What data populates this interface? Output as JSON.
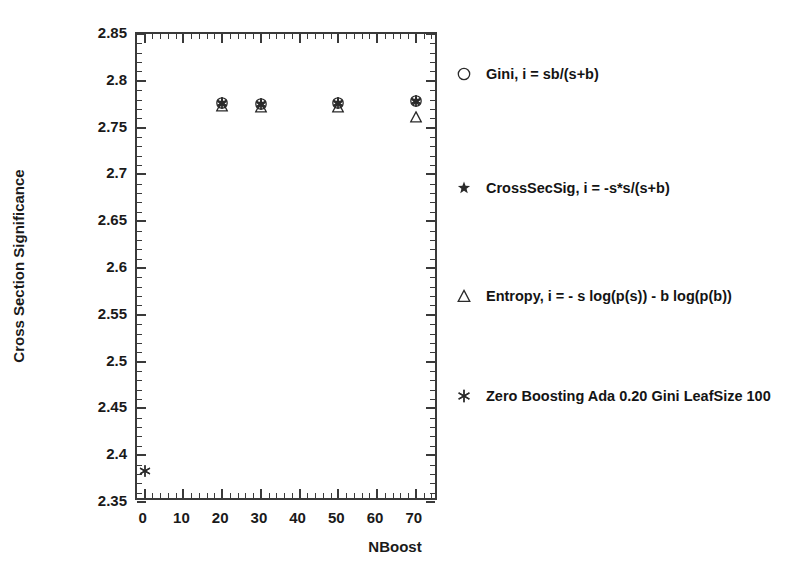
{
  "chart_data": {
    "type": "scatter",
    "title": "",
    "xlabel": "NBoost",
    "ylabel": "Cross Section Significance",
    "xlim": [
      -2,
      76
    ],
    "ylim": [
      2.35,
      2.85
    ],
    "xticks": [
      0,
      10,
      20,
      30,
      40,
      50,
      60,
      70
    ],
    "yticks": [
      2.35,
      2.4,
      2.45,
      2.5,
      2.55,
      2.6,
      2.65,
      2.7,
      2.75,
      2.8,
      2.85
    ],
    "ytick_step": 0.05,
    "yminor_per_major": 5,
    "xminor_per_major": 5,
    "grid": false,
    "legend_position": "right",
    "series": [
      {
        "name": "Gini, i = sb/(s+b)",
        "marker": "circle",
        "x": [
          20,
          30,
          50,
          70
        ],
        "y": [
          2.7765,
          2.7755,
          2.7765,
          2.7785
        ]
      },
      {
        "name": "CrossSecSig, i = -s*s/(s+b)",
        "marker": "star",
        "x": [
          20,
          30,
          50,
          70
        ],
        "y": [
          2.7765,
          2.7755,
          2.7765,
          2.7785
        ]
      },
      {
        "name": "Entropy, i = - s log(p(s)) - b log(p(b))",
        "marker": "triangle",
        "x": [
          20,
          30,
          50,
          70
        ],
        "y": [
          2.7735,
          2.7715,
          2.7725,
          2.761
        ]
      },
      {
        "name": "Zero Boosting Ada 0.20 Gini LeafSize 100",
        "marker": "asterisk",
        "x": [
          0,
          20,
          30,
          50,
          70
        ],
        "y": [
          2.383,
          2.7765,
          2.7755,
          2.7765,
          2.7785
        ]
      }
    ]
  },
  "axis": {
    "y_title": "Cross Section Significance",
    "x_title": "NBoost",
    "y_tick_labels": [
      "2.85",
      "2.8",
      "2.75",
      "2.7",
      "2.65",
      "2.6",
      "2.55",
      "2.5",
      "2.45",
      "2.4",
      "2.35"
    ],
    "x_tick_labels": [
      "0",
      "10",
      "20",
      "30",
      "40",
      "50",
      "60",
      "70"
    ]
  },
  "legend": {
    "items": [
      {
        "marker": "circle-marker",
        "label": "Gini, i = sb/(s+b)"
      },
      {
        "marker": "star-marker",
        "label": "CrossSecSig, i = -s*s/(s+b)"
      },
      {
        "marker": "triangle-marker",
        "label": "Entropy, i = - s log(p(s)) - b log(p(b))"
      },
      {
        "marker": "asterisk-marker",
        "label": "Zero Boosting Ada 0.20 Gini LeafSize 100"
      }
    ]
  },
  "colors": {
    "axis": "#3a3a3a",
    "marker": "#2b2b2b",
    "text": "#141414",
    "background": "#ffffff"
  }
}
